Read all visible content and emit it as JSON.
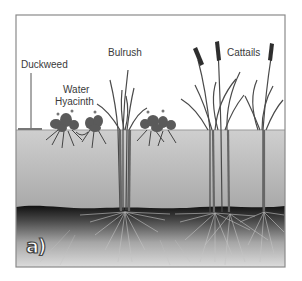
{
  "figure": {
    "panel_label": "a)",
    "labels": {
      "duckweed": "Duckweed",
      "water_hyacinth_line1": "Water",
      "water_hyacinth_line2": "Hyacinth",
      "bulrush": "Bulrush",
      "cattails": "Cattails"
    },
    "layers": [
      "air",
      "water",
      "sediment"
    ],
    "plants": [
      "Duckweed",
      "Water Hyacinth",
      "Bulrush",
      "Cattails"
    ],
    "colors": {
      "frame": "#8a8a8a",
      "water_top": "#c9c9c9",
      "water_bottom": "#a9a9a9",
      "sediment_top": "#1a1a1a",
      "sediment_bottom": "#d9d9d9",
      "plant": "#555555",
      "cattail_head": "#2e2e2e",
      "root": "#bdbdbd"
    }
  }
}
